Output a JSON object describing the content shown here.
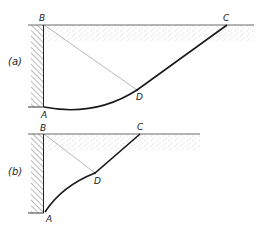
{
  "figure": {
    "panels": [
      {
        "id": "a",
        "panel_label": "(a)",
        "points": {
          "A": "A",
          "B": "B",
          "C": "C",
          "D": "D"
        },
        "description": "Retaining wall AB with curved slip surface A-D-C and straight chord B-D"
      },
      {
        "id": "b",
        "panel_label": "(b)",
        "points": {
          "A": "A",
          "B": "B",
          "C": "C",
          "D": "D"
        },
        "description": "Retaining wall AB with slip surface A-D-C and straight chord B-D"
      }
    ],
    "colors": {
      "line": "#1a1a1a",
      "thin_line": "#777777",
      "stipple": "#9a9a9a"
    }
  }
}
